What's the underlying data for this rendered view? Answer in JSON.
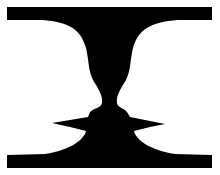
{
  "figure": {
    "subject": "Rubin vase illusion",
    "colors": {
      "background": "#ffffff",
      "foreground": "#000000"
    }
  }
}
